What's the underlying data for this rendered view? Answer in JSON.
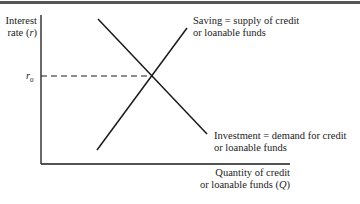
{
  "diagram": {
    "type": "supply-demand",
    "y_axis": {
      "line1": "Interest",
      "line2": "rate (",
      "var": "r",
      "close": ")"
    },
    "x_axis": {
      "line1": "Quantity of credit",
      "line2": "or loanable funds (",
      "var": "Q",
      "close": ")"
    },
    "equilibrium_label": {
      "var": "r",
      "sub": "0"
    },
    "curves": [
      {
        "name": "Saving",
        "line1": "Saving = supply of credit",
        "line2": "or loanable funds",
        "slope": "upward"
      },
      {
        "name": "Investment",
        "line1": "Investment = demand for credit",
        "line2": "or loanable funds",
        "slope": "downward"
      }
    ],
    "colors": {
      "line": "#1a1a1a",
      "topbar": "#555555"
    }
  }
}
